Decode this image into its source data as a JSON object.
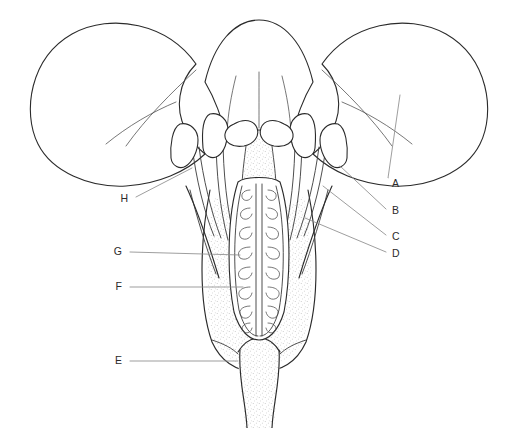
{
  "figure": {
    "style": "botanical line drawing",
    "background_color": "#ffffff",
    "ink_color": "#2b2b2b",
    "leader_color": "#8d8d8d",
    "width": 520,
    "height": 428
  },
  "labels": [
    {
      "id": "A",
      "text": "A",
      "text_x": 392,
      "text_y": 184,
      "target": "petal / corolla lobe",
      "leader": "M 388 178 L 388 178 L 400 95",
      "side": "right"
    },
    {
      "id": "B",
      "text": "B",
      "text_x": 392,
      "text_y": 211,
      "target": "anther",
      "leader": "M 386 209 L 340 166",
      "side": "right"
    },
    {
      "id": "C",
      "text": "C",
      "text_x": 392,
      "text_y": 237,
      "target": "filament / stamen",
      "leader": "M 386 235 L 323 186",
      "side": "right"
    },
    {
      "id": "D",
      "text": "D",
      "text_x": 392,
      "text_y": 254,
      "target": "sepal / calyx",
      "leader": "M 386 252 L 305 218",
      "side": "right"
    },
    {
      "id": "E",
      "text": "E",
      "text_x": 122,
      "text_y": 361,
      "target": "pedicel / receptacle",
      "leader": "M 130 361 L 238 361",
      "side": "left"
    },
    {
      "id": "F",
      "text": "F",
      "text_x": 122,
      "text_y": 287,
      "target": "ovule",
      "leader": "M 130 287 L 243 287",
      "side": "left"
    },
    {
      "id": "G",
      "text": "G",
      "text_x": 122,
      "text_y": 252,
      "target": "ovary locule / placenta",
      "leader": "M 130 252 L 240 255",
      "side": "left"
    },
    {
      "id": "H",
      "text": "H",
      "text_x": 128,
      "text_y": 199,
      "target": "anther (left stamen)",
      "leader": "M 136 197 L 192 168",
      "side": "left"
    }
  ],
  "parts": {
    "petals": [
      {
        "name": "left-petal",
        "note": "large reflexed lobe, left"
      },
      {
        "name": "center-petal",
        "note": "upright lobe, center rear"
      },
      {
        "name": "right-petal",
        "note": "large reflexed lobe, right"
      }
    ],
    "anthers": [
      {
        "name": "anther-left-outer"
      },
      {
        "name": "anther-left-inner"
      },
      {
        "name": "anther-right-inner"
      },
      {
        "name": "anther-right-outer"
      }
    ],
    "stigma_lobes": [
      {
        "name": "stigma-lobe-left"
      },
      {
        "name": "stigma-lobe-right"
      }
    ],
    "ovary": {
      "locules": 2,
      "ovules_per_locule": 8,
      "note": "two chambers with teardrop ovules on central placenta"
    },
    "pedicel": {
      "name": "pedicel",
      "note": "stippled stalk to lower edge"
    }
  }
}
